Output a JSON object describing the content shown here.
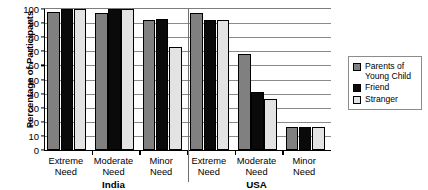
{
  "chart_data": {
    "type": "bar",
    "title": "",
    "xlabel": "",
    "ylabel": "Percentage of Participants",
    "ylim": [
      0,
      100
    ],
    "ytick_step": 10,
    "yticks": [
      0,
      10,
      20,
      30,
      40,
      50,
      60,
      70,
      80,
      90,
      100
    ],
    "grid": true,
    "legend_position": "right",
    "categories": [
      "Extreme\nNeed",
      "Moderate\nNeed",
      "Minor\nNeed",
      "Extreme\nNeed",
      "Moderate\nNeed",
      "Minor\nNeed"
    ],
    "group_labels": [
      "India",
      "USA"
    ],
    "groups": [
      {
        "country": "India",
        "categories": [
          "Extreme Need",
          "Moderate Need",
          "Minor Need"
        ],
        "values": {
          "Parents of Young Child": [
            98,
            97,
            92
          ],
          "Friend": [
            100,
            100,
            93
          ],
          "Stranger": [
            100,
            100,
            73
          ]
        }
      },
      {
        "country": "USA",
        "categories": [
          "Extreme Need",
          "Moderate Need",
          "Minor Need"
        ],
        "values": {
          "Parents of Young Child": [
            97,
            68,
            16
          ],
          "Friend": [
            92,
            41,
            16
          ],
          "Stranger": [
            92,
            36,
            16
          ]
        }
      }
    ],
    "series": [
      {
        "name": "Parents of\nYoung Child",
        "short_name": "Parents of Young Child",
        "color": "#808080",
        "values": [
          98,
          97,
          92,
          97,
          68,
          16
        ]
      },
      {
        "name": "Friend",
        "short_name": "Friend",
        "color": "#0a0a0a",
        "values": [
          100,
          100,
          93,
          92,
          41,
          16
        ]
      },
      {
        "name": "Stranger",
        "short_name": "Stranger",
        "color": "#e3e3e3",
        "values": [
          100,
          100,
          73,
          92,
          36,
          16
        ]
      }
    ]
  },
  "axis": {
    "y_title": "Percentage of Participants",
    "tick_labels": [
      "100",
      "90",
      "80",
      "70",
      "60",
      "50",
      "40",
      "30",
      "20",
      "10",
      "0"
    ]
  },
  "legend": {
    "items": [
      {
        "label": "Parents of\nYoung Child",
        "color": "#808080"
      },
      {
        "label": "Friend",
        "color": "#0a0a0a"
      },
      {
        "label": "Stranger",
        "color": "#e3e3e3"
      }
    ]
  },
  "colors": {
    "series_parents": "#808080",
    "series_friend": "#0a0a0a",
    "series_stranger": "#e3e3e3",
    "axis": "#000000",
    "grid": "#8a8a8a",
    "background": "#ffffff"
  }
}
